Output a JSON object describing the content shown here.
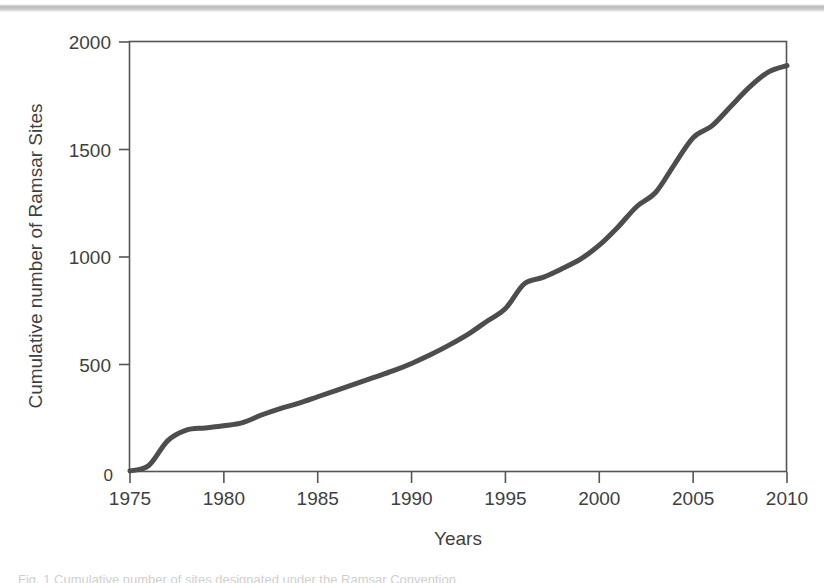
{
  "page": {
    "background_color": "#ffffff",
    "caption_cut_text": "Fig. 1   Cumulative number of sites designated under the Ramsar Convention"
  },
  "chart_data": {
    "type": "line",
    "title": "",
    "xlabel": "Years",
    "ylabel": "Cumulative number of Ramsar Sites",
    "xlim": [
      1975,
      2010
    ],
    "ylim": [
      0,
      2000
    ],
    "xticks": [
      1975,
      1980,
      1985,
      1990,
      1995,
      2000,
      2005,
      2010
    ],
    "xtick_labels": [
      "1975",
      "1980",
      "1985",
      "1990",
      "1995",
      "2000",
      "2005",
      "2010"
    ],
    "yticks": [
      0,
      500,
      1000,
      1500,
      2000
    ],
    "ytick_labels": [
      "0",
      "500",
      "1000",
      "1500",
      "2000"
    ],
    "grid": false,
    "legend": null,
    "line_color": "#4d4d4d",
    "line_width": 5,
    "frame_color": "#555555",
    "series": [
      {
        "name": "Cumulative Ramsar Sites",
        "x": [
          1975,
          1976,
          1977,
          1978,
          1979,
          1980,
          1981,
          1982,
          1983,
          1984,
          1985,
          1986,
          1987,
          1988,
          1989,
          1990,
          1991,
          1992,
          1993,
          1994,
          1995,
          1996,
          1997,
          1998,
          1999,
          2000,
          2001,
          2002,
          2003,
          2004,
          2005,
          2006,
          2007,
          2008,
          2009,
          2010
        ],
        "values": [
          5,
          30,
          145,
          195,
          205,
          215,
          230,
          265,
          295,
          320,
          350,
          380,
          410,
          440,
          470,
          505,
          545,
          590,
          640,
          700,
          760,
          875,
          905,
          945,
          990,
          1055,
          1140,
          1235,
          1300,
          1430,
          1555,
          1610,
          1700,
          1790,
          1860,
          1890
        ]
      }
    ],
    "annotations": [
      {
        "label": "plateau",
        "x_start": 1978,
        "x_end": 1981,
        "value": 205
      },
      {
        "label": "step",
        "x": 1982,
        "value": 265
      },
      {
        "label": "sharp-rise",
        "x": 1996,
        "value": 875
      },
      {
        "label": "plateau",
        "x": 2003,
        "value": 1300
      },
      {
        "label": "plateau",
        "x_start": 2005,
        "x_end": 2006,
        "value": 1580
      }
    ]
  }
}
